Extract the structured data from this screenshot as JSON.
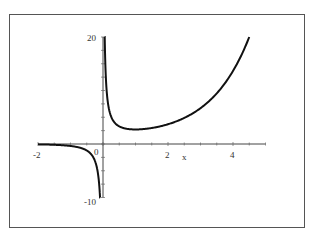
{
  "chart_data": {
    "type": "line",
    "title": "",
    "function": "e^x / x",
    "xlabel": "x",
    "ylabel": "",
    "xlim": [
      -2,
      5
    ],
    "ylim": [
      -10,
      20
    ],
    "x_ticks": [
      "-2",
      "0",
      "2",
      "4"
    ],
    "y_ticks": [
      "20",
      "-10"
    ],
    "grid": false,
    "legend": null,
    "series": [
      {
        "name": "f(x)",
        "color": "#111111",
        "branches": [
          {
            "x": [
              -2,
              -1.5,
              -1,
              -0.75,
              -0.5,
              -0.3,
              -0.2,
              -0.1,
              -0.09
            ],
            "y": [
              -0.07,
              -0.15,
              -0.37,
              -0.63,
              -1.21,
              -2.47,
              -4.09,
              -9.05,
              -10.1
            ]
          },
          {
            "x": [
              0.05,
              0.1,
              0.2,
              0.3,
              0.5,
              0.75,
              1,
              1.5,
              2,
              2.5,
              3,
              3.5,
              4,
              4.5
            ],
            "y": [
              21.0,
              11.05,
              6.11,
              4.5,
              3.3,
              2.82,
              2.72,
              2.99,
              3.69,
              4.87,
              6.7,
              9.46,
              13.65,
              20.0
            ]
          }
        ]
      }
    ]
  },
  "labels": {
    "x_axis": "x",
    "tick_neg2": "-2",
    "tick_0": "0",
    "tick_2": "2",
    "tick_4": "4",
    "tick_20": "20",
    "tick_neg10": "-10"
  }
}
